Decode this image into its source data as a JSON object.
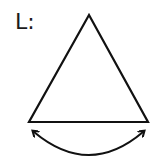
{
  "diagram": {
    "label": "L:",
    "shapes": [
      {
        "type": "triangle",
        "name": "equilateral-triangle",
        "points": [
          [
            89,
            15
          ],
          [
            29,
            122
          ],
          [
            148,
            122
          ]
        ]
      },
      {
        "type": "double-headed-curved-arrow",
        "name": "base-arc-arrow",
        "from": [
          33,
          131
        ],
        "to": [
          143,
          131
        ]
      }
    ],
    "stroke_color": "#111111"
  }
}
